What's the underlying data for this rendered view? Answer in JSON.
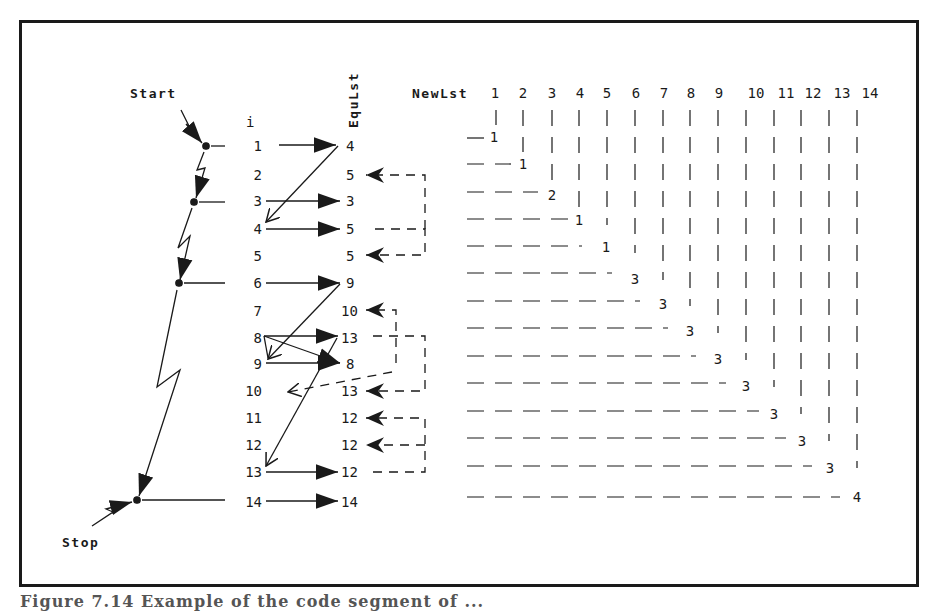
{
  "figure": {
    "caption": "Figure 7.14 Example of the code segment of ...",
    "colors": {
      "ink": "#1a1a1a",
      "background": "#ffffff"
    }
  },
  "labels": {
    "start": "Start",
    "stop": "Stop",
    "index_header": "i",
    "equlst_header": "EquLst",
    "newlst_header": "NewLst"
  },
  "index_column": [
    "1",
    "2",
    "3",
    "4",
    "5",
    "6",
    "7",
    "8",
    "9",
    "10",
    "11",
    "12",
    "13",
    "14"
  ],
  "equlst_column": [
    "4",
    "5",
    "3",
    "5",
    "5",
    "9",
    "10",
    "13",
    "8",
    "13",
    "12",
    "12",
    "12",
    "14"
  ],
  "scan_points": [
    1,
    3,
    6,
    14
  ],
  "newlst": {
    "columns": [
      "1",
      "2",
      "3",
      "4",
      "5",
      "6",
      "7",
      "8",
      "9",
      "10",
      "11",
      "12",
      "13",
      "14"
    ],
    "values": [
      "1",
      "1",
      "2",
      "1",
      "1",
      "3",
      "3",
      "3",
      "3",
      "3",
      "3",
      "3",
      "3",
      "4"
    ]
  },
  "solid_arrows": [
    {
      "from_i": 1,
      "to_equ_row": 1
    },
    {
      "from_equ_row": 1,
      "to_i": 4
    },
    {
      "from_i": 3,
      "to_equ_row": 3
    },
    {
      "from_i": 4,
      "to_equ_row": 4
    },
    {
      "from_i": 6,
      "to_equ_row": 6
    },
    {
      "from_equ_row": 6,
      "to_i": 9
    },
    {
      "from_i": 8,
      "to_equ_row": 8
    },
    {
      "from_i": 8,
      "to_equ_row": 9
    },
    {
      "from_i": 9,
      "to_equ_row": 9
    },
    {
      "from_equ_row": 8,
      "to_i": 13
    },
    {
      "from_i": 13,
      "to_equ_row": 13
    },
    {
      "from_i": 14,
      "to_equ_row": 14
    }
  ],
  "dashed_arrows": [
    {
      "from_equ_row": 4,
      "to_equ_row": 2
    },
    {
      "from_equ_row": 4,
      "to_equ_row": 5
    },
    {
      "from_equ_row": 9,
      "to_equ_row": 7
    },
    {
      "from_equ_row": 8,
      "to_equ_row": 10
    },
    {
      "from_equ_row": 13,
      "to_equ_row": 11
    },
    {
      "from_equ_row": 13,
      "to_equ_row": 12
    },
    {
      "from_equ_row": 10,
      "to_i": 10
    }
  ]
}
